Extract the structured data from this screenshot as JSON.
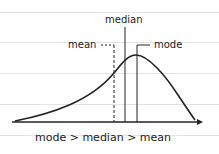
{
  "diagram": {
    "labels": {
      "median": "median",
      "mean": "mean",
      "mode": "mode",
      "relation": "mode > median > mean"
    },
    "colors": {
      "ink": "#222222",
      "ruled_line": "#e3e3e3",
      "background": "#ffffff"
    }
  }
}
